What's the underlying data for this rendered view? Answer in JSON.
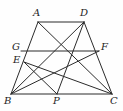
{
  "figure": {
    "width": 123,
    "height": 111,
    "stroke_color": "#2b2b2b",
    "background_color": "#fefefe",
    "label_color": "#1d1d1d",
    "points": [
      {
        "id": "A",
        "label": "A",
        "x": 38,
        "y": 22,
        "label_x": 33,
        "label_y": 8
      },
      {
        "id": "D",
        "label": "D",
        "x": 84,
        "y": 22,
        "label_x": 80,
        "label_y": 8
      },
      {
        "id": "G",
        "label": "G",
        "x": 21,
        "y": 51,
        "label_x": 12,
        "label_y": 42
      },
      {
        "id": "F",
        "label": "F",
        "x": 99,
        "y": 51,
        "label_x": 101,
        "label_y": 42
      },
      {
        "id": "E",
        "label": "E",
        "x": 24,
        "y": 62,
        "label_x": 13,
        "label_y": 55
      },
      {
        "id": "B",
        "label": "B",
        "x": 11,
        "y": 94,
        "label_x": 4,
        "label_y": 96
      },
      {
        "id": "P",
        "label": "P",
        "x": 57,
        "y": 94,
        "label_x": 53,
        "label_y": 96
      },
      {
        "id": "C",
        "label": "C",
        "x": 112,
        "y": 94,
        "label_x": 110,
        "label_y": 96
      }
    ],
    "segments": [
      {
        "name": "side-AD-top",
        "from": "A",
        "to": "D"
      },
      {
        "name": "side-AB-left",
        "from": "A",
        "to": "B"
      },
      {
        "name": "side-DC-right",
        "from": "D",
        "to": "C"
      },
      {
        "name": "side-BC-bottom",
        "from": "B",
        "to": "C"
      },
      {
        "name": "midsegment-GF",
        "from": "G",
        "to": "F"
      },
      {
        "name": "diagonal-AC",
        "from": "A",
        "to": "C"
      },
      {
        "name": "diagonal-DB",
        "from": "D",
        "to": "B"
      },
      {
        "name": "cevian-DP",
        "from": "D",
        "to": "P"
      },
      {
        "name": "cevian-EP",
        "from": "E",
        "to": "P"
      },
      {
        "name": "cevian-EC",
        "from": "E",
        "to": "C"
      },
      {
        "name": "cevian-BF",
        "from": "B",
        "to": "F"
      }
    ]
  }
}
